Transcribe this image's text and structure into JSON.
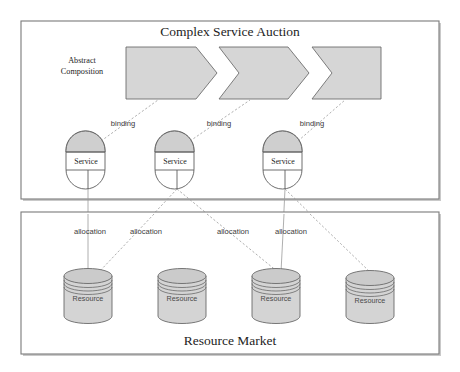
{
  "figure": {
    "kind": "architecture-diagram",
    "background_color": "#ffffff",
    "panels": [
      {
        "id": "complex-service-auction",
        "title": "Complex Service Auction",
        "side_label_line1": "Abstract",
        "side_label_line2": "Composition"
      },
      {
        "id": "resource-market",
        "title": "Resource Market"
      }
    ]
  },
  "top_panel": {
    "title": "Complex Service Auction",
    "side_label": {
      "line1": "Abstract",
      "line2": "Composition"
    },
    "chevrons": [
      {
        "id": "chevron-1",
        "label": "",
        "fill": "#d6d6d6",
        "notched_left": false
      },
      {
        "id": "chevron-2",
        "label": "",
        "fill": "#d6d6d6",
        "notched_left": true
      },
      {
        "id": "chevron-3",
        "label": "",
        "fill": "#d6d6d6",
        "notched_left": true
      }
    ],
    "services": [
      {
        "id": "service-1",
        "label": "Service"
      },
      {
        "id": "service-2",
        "label": "Service"
      },
      {
        "id": "service-3",
        "label": "Service"
      }
    ],
    "binding_labels": [
      {
        "id": "binding-1",
        "text": "binding"
      },
      {
        "id": "binding-2",
        "text": "binding"
      },
      {
        "id": "binding-3",
        "text": "binding"
      }
    ]
  },
  "bottom_panel": {
    "title": "Resource Market",
    "resources": [
      {
        "id": "resource-1",
        "label": "Resource"
      },
      {
        "id": "resource-2",
        "label": "Resource"
      },
      {
        "id": "resource-3",
        "label": "Resource"
      },
      {
        "id": "resource-4",
        "label": "Resource"
      }
    ],
    "allocation_labels": [
      {
        "id": "allocation-1",
        "text": "allocation"
      },
      {
        "id": "allocation-2",
        "text": "allocation"
      },
      {
        "id": "allocation-3",
        "text": "allocation"
      },
      {
        "id": "allocation-4",
        "text": "allocation"
      }
    ]
  },
  "colors": {
    "panel_border": "#7a7a7a",
    "chevron_fill": "#d6d6d6",
    "service_dome_fill": "#cfcfcf",
    "service_body_fill": "#ffffff",
    "cylinder_fill": "#d4d4d4",
    "connector": "#9a9a9a",
    "text": "#1d1d1d"
  }
}
